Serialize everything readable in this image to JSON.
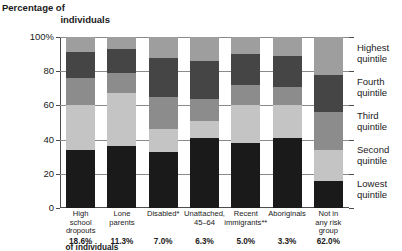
{
  "axis_title": {
    "line1": "Percentage of",
    "line2": "individuals"
  },
  "footnote_label": "of individuals",
  "chart_data": {
    "type": "bar",
    "subtype": "stacked-column-100",
    "title": "Percentage of individuals",
    "xlabel": "",
    "ylabel": "Percentage of individuals",
    "ylim": [
      0,
      100
    ],
    "ytick_labels": [
      "0",
      "20",
      "40",
      "60",
      "80",
      "100%"
    ],
    "yticks": [
      0,
      20,
      40,
      60,
      80,
      100
    ],
    "grid": true,
    "legend_position": "right",
    "categories": [
      "High school dropouts",
      "Lone parents",
      "Disabled*",
      "Unattached, 45–64",
      "Recent immigrants**",
      "Aboriginals",
      "Not in any risk group"
    ],
    "category_lines": [
      [
        "High",
        "school",
        "dropouts"
      ],
      [
        "Lone",
        "parents"
      ],
      [
        "Disabled*"
      ],
      [
        "Unattached,",
        "45–64"
      ],
      [
        "Recent",
        "immigrants**"
      ],
      [
        "Aboriginals"
      ],
      [
        "Not in",
        "any risk",
        "group"
      ]
    ],
    "category_percentages": [
      "18.6%",
      "11.3%",
      "7.0%",
      "6.3%",
      "5.0%",
      "3.3%",
      "62.0%"
    ],
    "series": [
      {
        "name": "Lowest quintile",
        "color": "#1a1a1a",
        "values": [
          34,
          36,
          33,
          41,
          38,
          41,
          16
        ]
      },
      {
        "name": "Second quintile",
        "color": "#c4c4c4",
        "values": [
          26,
          31,
          13,
          10,
          22,
          19,
          18
        ]
      },
      {
        "name": "Third quintile",
        "color": "#8c8c8c",
        "values": [
          16,
          12,
          19,
          13,
          12,
          11,
          22
        ]
      },
      {
        "name": "Fourth quintile",
        "color": "#454545",
        "values": [
          15,
          14,
          23,
          22,
          18,
          18,
          22
        ]
      },
      {
        "name": "Highest quintile",
        "color": "#9e9e9e",
        "values": [
          9,
          7,
          12,
          14,
          10,
          11,
          22
        ]
      }
    ],
    "legend_entries": [
      {
        "line1": "Highest",
        "line2": "quintile"
      },
      {
        "line1": "Fourth",
        "line2": "quintile"
      },
      {
        "line1": "Third",
        "line2": "quintile"
      },
      {
        "line1": "Second",
        "line2": "quintile"
      },
      {
        "line1": "Lowest",
        "line2": "quintile"
      }
    ]
  }
}
